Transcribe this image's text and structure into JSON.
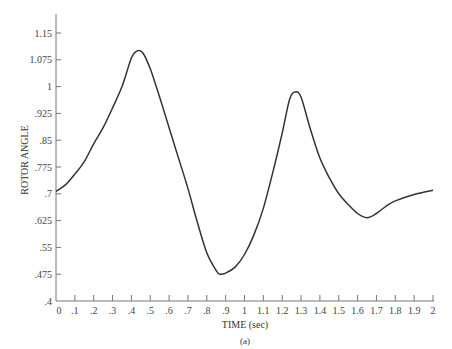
{
  "chart_data": {
    "type": "line",
    "title": "",
    "caption": "(a)",
    "xlabel": "TIME (sec)",
    "ylabel": "ROTOR ANGLE",
    "xlim": [
      0,
      2
    ],
    "ylim": [
      0.4,
      1.15
    ],
    "grid": false,
    "legend": null,
    "x_ticks": [
      "0",
      ".1",
      ".2",
      ".3",
      ".4",
      ".5",
      ".6",
      ".7",
      ".8",
      ".9",
      "1",
      "1.1",
      "1.2",
      "1.3",
      "1.4",
      "1.5",
      "1.6",
      "1.7",
      "1.8",
      "1.9",
      "2"
    ],
    "y_ticks": [
      ".4",
      ".475",
      ".55",
      ".625",
      ".7",
      ".775",
      ".85",
      ".925",
      "1",
      "1.075",
      "1.15"
    ],
    "series": [
      {
        "name": "rotor angle",
        "x": [
          0.0,
          0.05,
          0.1,
          0.15,
          0.2,
          0.25,
          0.3,
          0.35,
          0.4,
          0.43,
          0.46,
          0.5,
          0.55,
          0.6,
          0.65,
          0.7,
          0.75,
          0.8,
          0.85,
          0.87,
          0.9,
          0.95,
          1.0,
          1.05,
          1.1,
          1.15,
          1.2,
          1.24,
          1.27,
          1.3,
          1.35,
          1.4,
          1.45,
          1.5,
          1.55,
          1.6,
          1.65,
          1.7,
          1.75,
          1.8,
          1.9,
          2.0
        ],
        "y": [
          0.707,
          0.725,
          0.755,
          0.79,
          0.84,
          0.885,
          0.94,
          1.0,
          1.08,
          1.1,
          1.095,
          1.05,
          0.97,
          0.885,
          0.8,
          0.715,
          0.62,
          0.535,
          0.485,
          0.475,
          0.478,
          0.495,
          0.53,
          0.585,
          0.66,
          0.76,
          0.87,
          0.965,
          0.985,
          0.97,
          0.88,
          0.8,
          0.745,
          0.7,
          0.67,
          0.645,
          0.633,
          0.645,
          0.665,
          0.68,
          0.698,
          0.71
        ]
      }
    ]
  }
}
